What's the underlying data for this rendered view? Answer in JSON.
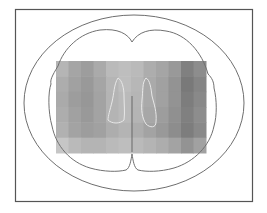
{
  "figure": {
    "kind": "axial brain slice schematic",
    "colors": {
      "background": "#ffffff",
      "frame": "#555555",
      "outline": "#6e6e6e",
      "ventricle_outline": "#e8e8e8",
      "midline": "#6a6a6a"
    },
    "intensity_map": {
      "description": "grayscale intensity overlay",
      "columns": 12,
      "rows": 6,
      "values": [
        [
          0.45,
          0.55,
          0.6,
          0.52,
          0.42,
          0.4,
          0.42,
          0.5,
          0.55,
          0.62,
          0.78,
          0.7
        ],
        [
          0.5,
          0.58,
          0.62,
          0.55,
          0.45,
          0.4,
          0.44,
          0.52,
          0.58,
          0.66,
          0.82,
          0.75
        ],
        [
          0.52,
          0.6,
          0.64,
          0.56,
          0.46,
          0.42,
          0.45,
          0.52,
          0.58,
          0.66,
          0.8,
          0.72
        ],
        [
          0.5,
          0.58,
          0.62,
          0.56,
          0.46,
          0.42,
          0.46,
          0.54,
          0.6,
          0.68,
          0.78,
          0.7
        ],
        [
          0.48,
          0.56,
          0.6,
          0.58,
          0.5,
          0.46,
          0.5,
          0.56,
          0.62,
          0.7,
          0.8,
          0.72
        ],
        [
          0.35,
          0.42,
          0.46,
          0.46,
          0.42,
          0.4,
          0.42,
          0.46,
          0.5,
          0.56,
          0.66,
          0.58
        ]
      ]
    }
  }
}
